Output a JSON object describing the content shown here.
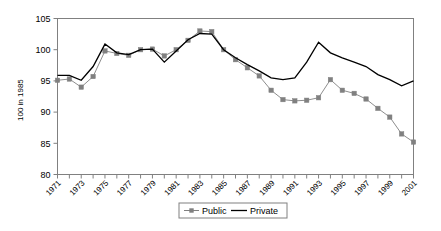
{
  "chart_data": {
    "type": "line",
    "title": "",
    "subtitle": "",
    "xlabel": "",
    "ylabel": "100 in 1985",
    "ylim": [
      80,
      105
    ],
    "xlim": [
      1971,
      2001
    ],
    "yticks": [
      80,
      85,
      90,
      95,
      100,
      105
    ],
    "ytick_labels": [
      "80",
      "85",
      "90",
      "95",
      "100",
      "105"
    ],
    "x": [
      1971,
      1972,
      1973,
      1974,
      1975,
      1976,
      1977,
      1978,
      1979,
      1980,
      1981,
      1982,
      1983,
      1984,
      1985,
      1986,
      1987,
      1988,
      1989,
      1990,
      1991,
      1992,
      1993,
      1994,
      1995,
      1996,
      1997,
      1998,
      1999,
      2000,
      2001
    ],
    "xtick_labels": [
      "1971",
      "1972",
      "1973",
      "1974",
      "1975",
      "1976",
      "1977",
      "1978",
      "1979",
      "1980",
      "1981",
      "1982",
      "1983",
      "1984",
      "1985",
      "1986",
      "1987",
      "1988",
      "1989",
      "1990",
      "1991",
      "1992",
      "1993",
      "1994",
      "1995",
      "1996",
      "1997",
      "1998",
      "1999",
      "2000",
      "2001"
    ],
    "xtick_labels_shown": [
      "1971",
      "1973",
      "1975",
      "1977",
      "1979",
      "1981",
      "1983",
      "1985",
      "1987",
      "1989",
      "1991",
      "1993",
      "1995",
      "1997",
      "1999",
      "2001"
    ],
    "grid": false,
    "legend_position": "bottom-center",
    "series": [
      {
        "name": "Public",
        "color": "#808080",
        "marker": "square",
        "values": [
          95.1,
          95.3,
          94.0,
          95.7,
          99.8,
          99.4,
          99.1,
          100.0,
          100.1,
          99.0,
          100.0,
          101.5,
          103.0,
          102.9,
          100.0,
          98.4,
          97.1,
          95.8,
          93.5,
          92.0,
          91.8,
          91.9,
          92.3,
          95.2,
          93.5,
          93.0,
          92.1,
          90.6,
          89.2,
          86.5,
          85.2
        ]
      },
      {
        "name": "Private",
        "color": "#000000",
        "marker": "none",
        "values": [
          95.9,
          95.9,
          95.1,
          97.3,
          100.9,
          99.5,
          99.2,
          100.0,
          100.1,
          98.0,
          99.8,
          101.6,
          102.6,
          102.5,
          100.0,
          98.7,
          97.6,
          96.6,
          95.5,
          95.2,
          95.5,
          98.0,
          101.2,
          99.5,
          98.7,
          98.0,
          97.3,
          96.0,
          95.2,
          94.2,
          95.0
        ]
      }
    ]
  },
  "legend": {
    "items": [
      {
        "label": "Public",
        "color": "#808080",
        "marker": "square"
      },
      {
        "label": "Private",
        "color": "#000000",
        "marker": "none"
      }
    ]
  },
  "axes": {
    "y_axis_label": "100 in 1985"
  }
}
